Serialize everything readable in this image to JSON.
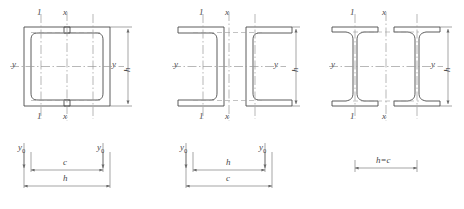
{
  "figure": {
    "groups": [
      {
        "id": "group-1",
        "name": "channels-toe-to-toe",
        "section_type": "channel",
        "orientation": "flanges-facing-inward",
        "count": 2,
        "axis_labels": {
          "top_left": "1",
          "top_center": "x",
          "bottom_left": "1",
          "bottom_center": "x",
          "left": "y",
          "right": "y"
        },
        "vertical_dimension": "h",
        "bottom_dimensions": {
          "upper_row": [
            "y",
            "c",
            "y"
          ],
          "upper_row_subscripts": [
            "0",
            "",
            "0"
          ],
          "lower_row": "h"
        }
      },
      {
        "id": "group-2",
        "name": "channels-back-to-back",
        "section_type": "channel",
        "orientation": "flanges-facing-outward",
        "count": 2,
        "axis_labels": {
          "top_left": "1",
          "top_center": "x",
          "bottom_left": "1",
          "bottom_center": "x",
          "left": "y",
          "right": "y"
        },
        "vertical_dimension": "h",
        "bottom_dimensions": {
          "upper_row": [
            "y",
            "h",
            "y"
          ],
          "upper_row_subscripts": [
            "0",
            "",
            "0"
          ],
          "lower_row": "c"
        }
      },
      {
        "id": "group-3",
        "name": "paired-i-beams",
        "section_type": "i-beam",
        "orientation": "upright",
        "count": 2,
        "axis_labels": {
          "top_left": "1",
          "top_center": "x",
          "bottom_left": "1",
          "bottom_center": "x",
          "left": "y",
          "right": "y"
        },
        "vertical_dimension": "h",
        "bottom_dimensions": {
          "upper_row": [],
          "upper_row_subscripts": [],
          "lower_row": "h=c"
        }
      }
    ],
    "colors": {
      "outline": "#4a4a4a",
      "centerline": "#8a8a8a",
      "dimension": "#6a6a6a",
      "background": "#ffffff"
    }
  }
}
